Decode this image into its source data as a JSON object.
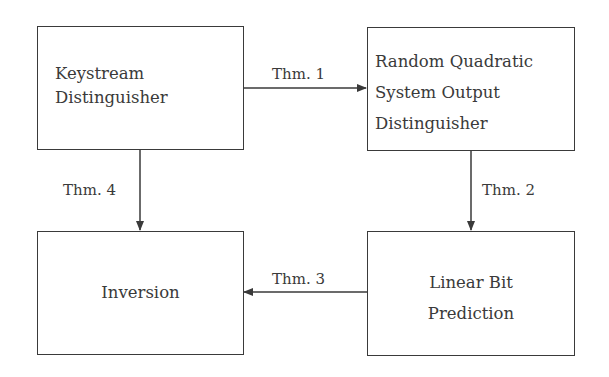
{
  "diagram": {
    "nodes": [
      {
        "id": "keystream",
        "lines": [
          "Keystream",
          "Distinguisher"
        ]
      },
      {
        "id": "rqs",
        "lines": [
          "Random Quadratic",
          "System Output",
          "Distinguisher"
        ]
      },
      {
        "id": "inversion",
        "lines": [
          "Inversion"
        ]
      },
      {
        "id": "linear",
        "lines": [
          "Linear Bit",
          "Prediction"
        ]
      }
    ],
    "edges": [
      {
        "from": "keystream",
        "to": "rqs",
        "label": "Thm. 1"
      },
      {
        "from": "rqs",
        "to": "linear",
        "label": "Thm. 2"
      },
      {
        "from": "linear",
        "to": "inversion",
        "label": "Thm. 3"
      },
      {
        "from": "keystream",
        "to": "inversion",
        "label": "Thm. 4"
      }
    ],
    "colors": {
      "stroke": "#3a3a3a",
      "background": "#ffffff"
    }
  }
}
